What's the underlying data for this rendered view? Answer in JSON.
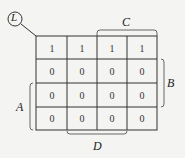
{
  "diagram": {
    "corner_label": "L",
    "grid": [
      [
        "1",
        "1",
        "1",
        "1"
      ],
      [
        "0",
        "0",
        "0",
        "0"
      ],
      [
        "0",
        "0",
        "0",
        "0"
      ],
      [
        "0",
        "0",
        "0",
        "0"
      ]
    ],
    "labels": {
      "A": "A",
      "B": "B",
      "C": "C",
      "D": "D"
    }
  }
}
